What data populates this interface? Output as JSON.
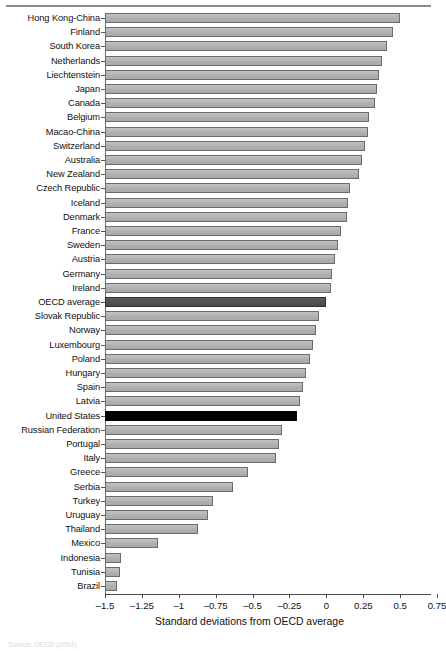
{
  "figure": {
    "source_note": "Source: OECD (2004)"
  },
  "chart_data": {
    "type": "bar",
    "orientation": "horizontal",
    "title": "",
    "xlabel": "Standard deviations from OECD average",
    "ylabel": "",
    "xlim": [
      -1.5,
      0.75
    ],
    "xticks": [
      -1.5,
      -1.25,
      -1,
      -0.75,
      -0.5,
      -0.25,
      0,
      0.25,
      0.5,
      0.75
    ],
    "xtick_labels": [
      "–1.5",
      "–1.25",
      "–1",
      "–0.75",
      "–0.5",
      "–0.25",
      "0",
      "0.25",
      "0.5",
      "0.75"
    ],
    "grid": false,
    "legend": "none",
    "bar_baseline": -1.5,
    "highlight_colors": {
      "default": "#b4b4b4",
      "oecd_average": "#4d4d4d",
      "united_states": "#000000"
    },
    "categories": [
      "Hong Kong-China",
      "Finland",
      "South Korea",
      "Netherlands",
      "Liechtenstein",
      "Japan",
      "Canada",
      "Belgium",
      "Macao-China",
      "Switzerland",
      "Australia",
      "New Zealand",
      "Czech Republic",
      "Iceland",
      "Denmark",
      "France",
      "Sweden",
      "Austria",
      "Germany",
      "Ireland",
      "OECD average",
      "Slovak Republic",
      "Norway",
      "Luxembourg",
      "Poland",
      "Hungary",
      "Spain",
      "Latvia",
      "United States",
      "Russian Federation",
      "Portugal",
      "Italy",
      "Greece",
      "Serbia",
      "Turkey",
      "Uruguay",
      "Thailand",
      "Mexico",
      "Indonesia",
      "Tunisia",
      "Brazil"
    ],
    "values": [
      0.5,
      0.45,
      0.41,
      0.38,
      0.36,
      0.34,
      0.33,
      0.29,
      0.28,
      0.26,
      0.24,
      0.22,
      0.16,
      0.15,
      0.14,
      0.1,
      0.08,
      0.06,
      0.04,
      0.03,
      0.0,
      -0.05,
      -0.07,
      -0.09,
      -0.11,
      -0.14,
      -0.16,
      -0.18,
      -0.2,
      -0.3,
      -0.32,
      -0.34,
      -0.53,
      -0.63,
      -0.77,
      -0.8,
      -0.87,
      -1.14,
      -1.39,
      -1.4,
      -1.42
    ],
    "series_name": "Mathematics performance"
  }
}
